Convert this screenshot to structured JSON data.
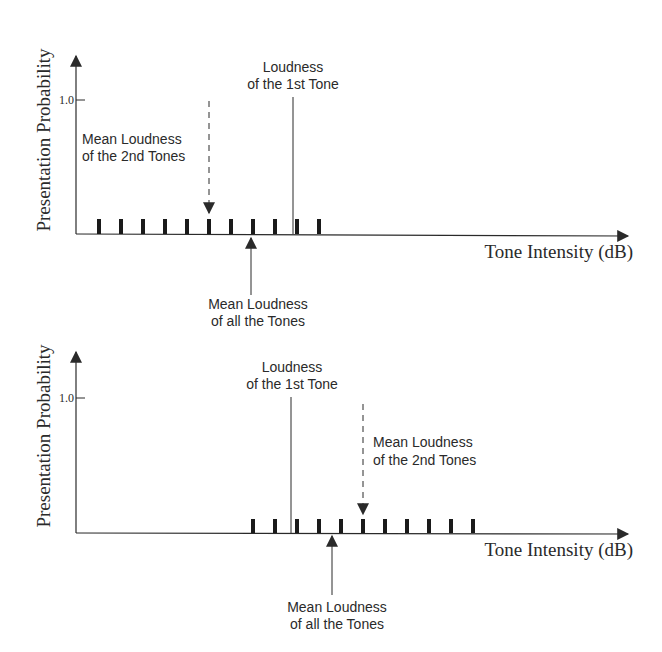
{
  "panels": [
    {
      "id": "top",
      "y_axis_label": "Presentation Probability",
      "y_tick_label": "1.0",
      "x_axis_label": "Tone Intensity (dB)",
      "first_tone_label": [
        "Loudness",
        "of the 1st Tone"
      ],
      "second_tones_label": [
        "Mean Loudness",
        "of the 2nd Tones"
      ],
      "all_tones_label": [
        "Mean Loudness",
        "of all the Tones"
      ],
      "bar_count": 11,
      "note": "2nd tones mean below 1st tone loudness"
    },
    {
      "id": "bottom",
      "y_axis_label": "Presentation Probability",
      "y_tick_label": "1.0",
      "x_axis_label": "Tone Intensity (dB)",
      "first_tone_label": [
        "Loudness",
        "of the 1st Tone"
      ],
      "second_tones_label": [
        "Mean Loudness",
        "of the 2nd Tones"
      ],
      "all_tones_label": [
        "Mean Loudness",
        "of all the Tones"
      ],
      "bar_count": 11,
      "note": "2nd tones mean above 1st tone loudness"
    }
  ],
  "colors": {
    "ink": "#2a2a2a",
    "background": "#ffffff"
  }
}
